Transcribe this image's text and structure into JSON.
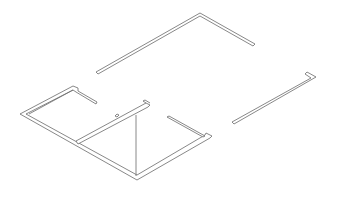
{
  "diagram": {
    "type": "isometric-floor-plan-walls",
    "background": "#ffffff",
    "line_color": "#6a6a6a",
    "elements": [
      {
        "name": "top-l-wall",
        "description": "long wall going up-right then turning down-right"
      },
      {
        "name": "right-hook-wall",
        "description": "diagonal wall with hook end on right"
      },
      {
        "name": "left-room-walls",
        "description": "outer perimeter of lower-left rooms"
      },
      {
        "name": "inner-partition-wall",
        "description": "interior wall with small tab"
      },
      {
        "name": "short-partition-wall",
        "description": "short wall stub near right corner"
      },
      {
        "name": "vertical-edge-line",
        "description": "thin vertical line at front corner"
      }
    ]
  }
}
